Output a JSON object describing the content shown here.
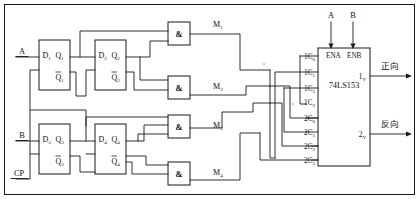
{
  "figure": {
    "kind": "logic-circuit-schematic"
  },
  "inputs": [
    {
      "name": "input-a",
      "label": "A"
    },
    {
      "name": "input-b",
      "label": "B"
    },
    {
      "name": "input-cp",
      "label": "CP"
    }
  ],
  "select_inputs": [
    {
      "name": "select-a",
      "label": "A"
    },
    {
      "name": "select-b",
      "label": "B"
    }
  ],
  "flipflops": [
    {
      "name": "ff1",
      "d": "D",
      "d_sub": "1",
      "q": "Q",
      "q_sub": "1",
      "qbar": "Q",
      "qbar_sub": "1"
    },
    {
      "name": "ff2",
      "d": "D",
      "d_sub": "2",
      "q": "Q",
      "q_sub": "2",
      "qbar": "Q",
      "qbar_sub": "2"
    },
    {
      "name": "ff3",
      "d": "D",
      "d_sub": "3",
      "q": "Q",
      "q_sub": "3",
      "qbar": "Q",
      "qbar_sub": "3"
    },
    {
      "name": "ff4",
      "d": "D",
      "d_sub": "4",
      "q": "Q",
      "q_sub": "4",
      "qbar": "Q",
      "qbar_sub": "4"
    }
  ],
  "gates": [
    {
      "name": "and-gate-1",
      "symbol": "&",
      "out": "M",
      "out_sub": "1"
    },
    {
      "name": "and-gate-2",
      "symbol": "&",
      "out": "M",
      "out_sub": "2"
    },
    {
      "name": "and-gate-3",
      "symbol": "&",
      "out": "M",
      "out_sub": "3"
    },
    {
      "name": "and-gate-4",
      "symbol": "&",
      "out": "M",
      "out_sub": "4"
    }
  ],
  "chip": {
    "part_number": "74LS153",
    "enable_a": "ENA",
    "enable_b": "ENB",
    "bank1": [
      {
        "prefix": "1C",
        "sub": "0"
      },
      {
        "prefix": "1C",
        "sub": "1"
      },
      {
        "prefix": "1C",
        "sub": "2"
      },
      {
        "prefix": "1C",
        "sub": "3"
      }
    ],
    "bank2": [
      {
        "prefix": "2C",
        "sub": "0"
      },
      {
        "prefix": "2C",
        "sub": "1"
      },
      {
        "prefix": "2C",
        "sub": "2"
      },
      {
        "prefix": "2C",
        "sub": "3"
      }
    ],
    "outputs": [
      {
        "name": "output-1y",
        "prefix": "1",
        "sub": "Y",
        "annotation": "正向"
      },
      {
        "name": "output-2y",
        "prefix": "2",
        "sub": "Y",
        "annotation": "反向"
      }
    ]
  },
  "colors": {
    "ink": "#1a1a1a",
    "background": "#ffffff"
  }
}
